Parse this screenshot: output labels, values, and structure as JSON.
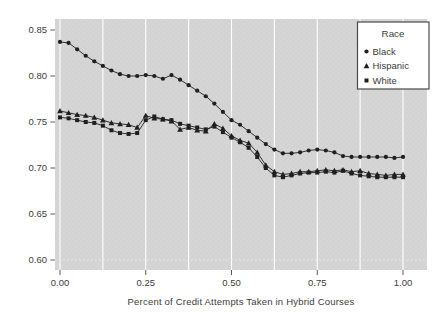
{
  "chart_data": {
    "type": "line",
    "title": "",
    "xlabel": "Percent of Credit Attempts Taken in Hybrid Courses",
    "ylabel": "",
    "xlim": [
      -0.015,
      1.07
    ],
    "ylim": [
      0.592,
      0.862
    ],
    "grid": "vertical-white-gridlines",
    "x_gridlines": [
      0,
      0.125,
      0.25,
      0.375,
      0.5,
      0.625,
      0.75,
      0.875,
      1.0
    ],
    "x_ticks": [
      0.0,
      0.25,
      0.5,
      0.75,
      1.0
    ],
    "x_tick_labels": [
      "0.00",
      "0.25",
      "0.50",
      "0.75",
      "1.00"
    ],
    "y_ticks": [
      0.85,
      0.8,
      0.75,
      0.7,
      0.65,
      0.6
    ],
    "y_tick_labels": [
      "0.85",
      "0.80",
      "0.75",
      "0.70",
      "0.65",
      "0.60"
    ],
    "dotted_baseline_y": 0.6,
    "legend": {
      "title": "Race",
      "position": "top-right"
    },
    "x": [
      0.0,
      0.025,
      0.05,
      0.075,
      0.1,
      0.125,
      0.15,
      0.175,
      0.2,
      0.225,
      0.25,
      0.275,
      0.3,
      0.325,
      0.35,
      0.375,
      0.4,
      0.425,
      0.45,
      0.475,
      0.5,
      0.525,
      0.55,
      0.575,
      0.6,
      0.625,
      0.65,
      0.675,
      0.7,
      0.725,
      0.75,
      0.775,
      0.8,
      0.825,
      0.85,
      0.875,
      0.9,
      0.925,
      0.95,
      0.975,
      1.0
    ],
    "series": [
      {
        "name": "Black",
        "marker": "circle",
        "values": [
          0.837,
          0.836,
          0.829,
          0.822,
          0.816,
          0.811,
          0.806,
          0.802,
          0.8,
          0.8,
          0.801,
          0.8,
          0.797,
          0.801,
          0.796,
          0.79,
          0.784,
          0.778,
          0.77,
          0.761,
          0.752,
          0.747,
          0.74,
          0.733,
          0.726,
          0.72,
          0.716,
          0.716,
          0.717,
          0.719,
          0.72,
          0.719,
          0.717,
          0.713,
          0.712,
          0.712,
          0.712,
          0.712,
          0.712,
          0.711,
          0.712
        ]
      },
      {
        "name": "Hispanic",
        "marker": "triangle",
        "values": [
          0.762,
          0.76,
          0.758,
          0.757,
          0.755,
          0.752,
          0.749,
          0.748,
          0.747,
          0.744,
          0.757,
          0.754,
          0.753,
          0.751,
          0.742,
          0.744,
          0.741,
          0.74,
          0.748,
          0.743,
          0.735,
          0.73,
          0.727,
          0.717,
          0.703,
          0.696,
          0.693,
          0.694,
          0.696,
          0.696,
          0.697,
          0.698,
          0.697,
          0.698,
          0.696,
          0.697,
          0.694,
          0.693,
          0.692,
          0.693,
          0.693
        ]
      },
      {
        "name": "White",
        "marker": "square",
        "values": [
          0.755,
          0.754,
          0.752,
          0.75,
          0.749,
          0.746,
          0.741,
          0.738,
          0.737,
          0.738,
          0.752,
          0.756,
          0.753,
          0.752,
          0.748,
          0.746,
          0.744,
          0.742,
          0.745,
          0.739,
          0.733,
          0.728,
          0.722,
          0.712,
          0.7,
          0.692,
          0.69,
          0.692,
          0.694,
          0.695,
          0.695,
          0.696,
          0.695,
          0.697,
          0.694,
          0.692,
          0.691,
          0.69,
          0.69,
          0.69,
          0.69
        ]
      }
    ],
    "colors": {
      "outer_bg": "#ffffff",
      "plot_bg": "#d2d2d2",
      "plot_bg_alt": "#d6d6d6",
      "gridline": "#ffffff",
      "series": "#1f1f1f",
      "tick": "#5a5a5a",
      "text": "#3c3c3c",
      "legend_bg": "#ffffff",
      "legend_border": "#4a4a4a"
    }
  }
}
